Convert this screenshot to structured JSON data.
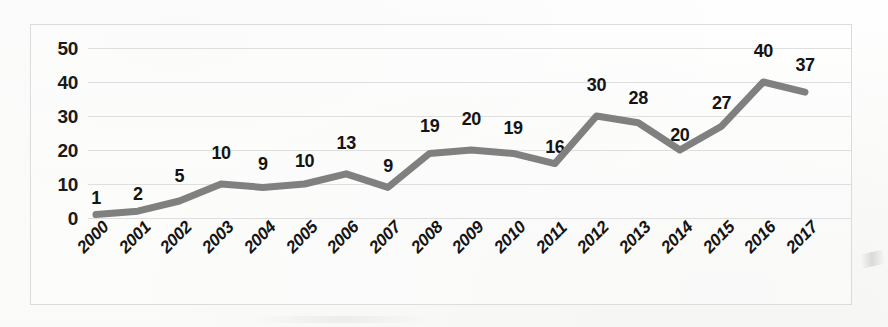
{
  "chart_data": {
    "type": "line",
    "title": "",
    "subtitle": "",
    "xlabel": "",
    "ylabel": "",
    "categories": [
      "2000",
      "2001",
      "2002",
      "2003",
      "2004",
      "2005",
      "2006",
      "2007",
      "2008",
      "2009",
      "2010",
      "2011",
      "2012",
      "2013",
      "2014",
      "2015",
      "2016",
      "2017"
    ],
    "values": [
      1,
      2,
      5,
      10,
      9,
      10,
      13,
      9,
      19,
      20,
      19,
      16,
      30,
      28,
      20,
      27,
      40,
      37
    ],
    "data_labels": [
      "1",
      "2",
      "5",
      "10",
      "9",
      "10",
      "13",
      "9",
      "19",
      "20",
      "19",
      "16",
      "30",
      "28",
      "20",
      "27",
      "40",
      "37"
    ],
    "ylim": [
      0,
      50
    ],
    "yticks": [
      0,
      10,
      20,
      30,
      40,
      50
    ],
    "ytick_labels": [
      "0",
      "10",
      "20",
      "30",
      "40",
      "50"
    ],
    "grid": true,
    "grid_axis": "y",
    "legend": false,
    "legend_position": "none",
    "xtick_rotation": -45,
    "series": [
      {
        "name": "series-1",
        "color": "#808080",
        "line_width": 7,
        "markers": false,
        "values": [
          1,
          2,
          5,
          10,
          9,
          10,
          13,
          9,
          19,
          20,
          19,
          16,
          30,
          28,
          20,
          27,
          40,
          37
        ]
      }
    ],
    "colors": {
      "line": "#808080",
      "grid": "#d9d9d9",
      "border": "#dcdcdc",
      "text": "#141414",
      "background": "#fdfdfc"
    }
  }
}
